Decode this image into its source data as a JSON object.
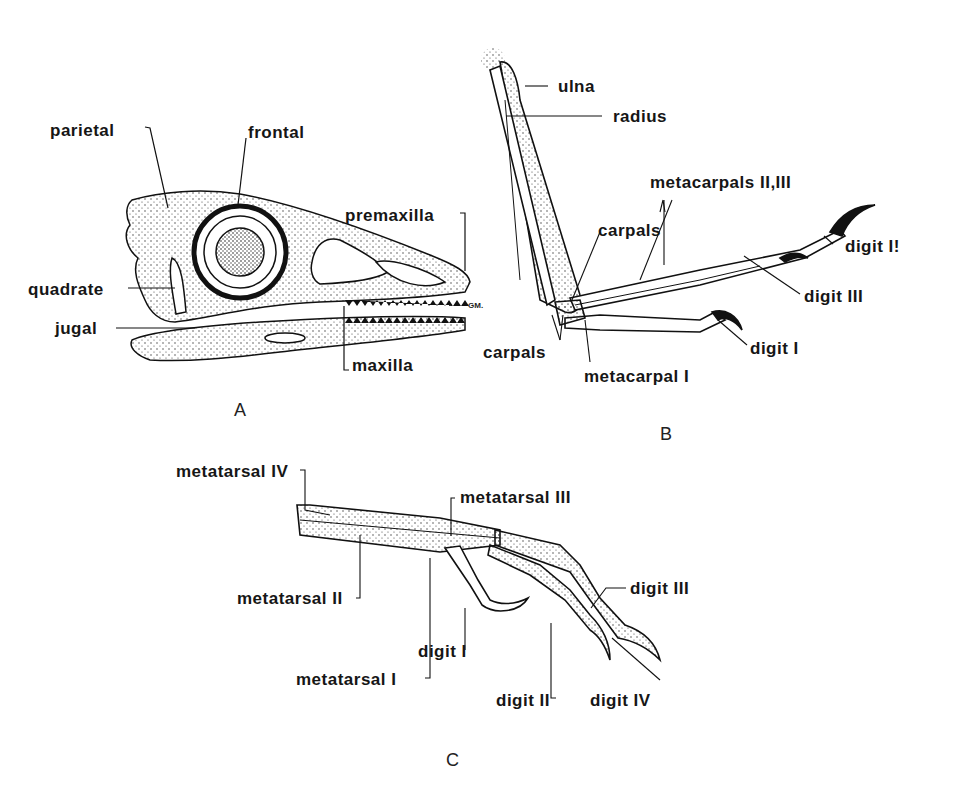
{
  "figure": {
    "panels": [
      {
        "id": "A",
        "letter": "A",
        "subject": "skull (lateral view)",
        "labels": [
          "parietal",
          "frontal",
          "premaxilla",
          "quadrate",
          "jugal",
          "maxilla"
        ],
        "signature": "GM."
      },
      {
        "id": "B",
        "letter": "B",
        "subject": "forelimb / hand",
        "labels": [
          "ulna",
          "radius",
          "metacarpals II,III",
          "carpals",
          "digit II",
          "digit III",
          "carpals",
          "digit I",
          "metacarpal I"
        ]
      },
      {
        "id": "C",
        "letter": "C",
        "subject": "foot",
        "labels": [
          "metatarsal IV",
          "metatarsal III",
          "metatarsal II",
          "digit III",
          "digit I",
          "metatarsal I",
          "digit II",
          "digit IV"
        ]
      }
    ]
  },
  "A": {
    "parietal": "parietal",
    "frontal": "frontal",
    "premaxilla": "premaxilla",
    "quadrate": "quadrate",
    "jugal": "jugal",
    "maxilla": "maxilla",
    "signature": "GM.",
    "letter": "A"
  },
  "B": {
    "ulna": "ulna",
    "radius": "radius",
    "metacarpals": "metacarpals II,III",
    "carpals_upper": "carpals",
    "digit2": "digit I!",
    "digit3": "digit III",
    "carpals_lower": "carpals",
    "digit1": "digit I",
    "metacarpal1": "metacarpal I",
    "letter": "B"
  },
  "C": {
    "mt4": "metatarsal IV",
    "mt3": "metatarsal III",
    "mt2": "metatarsal II",
    "d3": "digit III",
    "d1": "digit I",
    "mt1": "metatarsal I",
    "d2": "digit II",
    "d4": "digit IV",
    "letter": "C"
  }
}
